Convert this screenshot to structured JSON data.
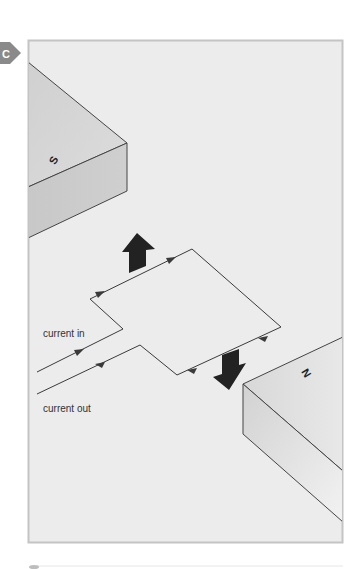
{
  "panel": {
    "badge": "C",
    "colors": {
      "background": "#ececec",
      "frame_border": "#c4c4c4",
      "badge": "#8a8a8a",
      "wire": "#3a3a3a",
      "force_arrow": "#222222",
      "magnet_top": "#d6d6d6",
      "magnet_front": "#c6c6c6"
    }
  },
  "magnets": {
    "south": {
      "label": "S"
    },
    "north": {
      "label": "N"
    }
  },
  "wires": {
    "in_label": "current in",
    "out_label": "current out"
  },
  "force_arrows": [
    {
      "direction": "up"
    },
    {
      "direction": "down"
    }
  ]
}
